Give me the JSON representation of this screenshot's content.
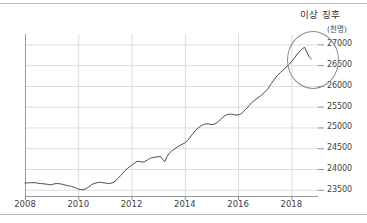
{
  "chart_data": {
    "type": "line",
    "title": "",
    "subtitle": "",
    "xlabel": "",
    "ylabel": "",
    "unit_label": "(천명)",
    "annotations": [
      {
        "name": "abnormal-sign",
        "text": "이상 징후",
        "shape": "ellipse",
        "targets_x_range": [
          2017.2,
          2018.9
        ],
        "targets_y_range": [
          26450,
          27050
        ]
      }
    ],
    "grid": true,
    "legend": "none",
    "xlim": [
      2008.0,
      2019.0
    ],
    "ylim": [
      23350,
      27250
    ],
    "xticks": [
      "2008",
      "2010",
      "2012",
      "2014",
      "2016",
      "2018"
    ],
    "xtick_values": [
      2008,
      2010,
      2012,
      2014,
      2016,
      2018
    ],
    "yticks": [
      "23500",
      "24000",
      "24500",
      "25000",
      "25500",
      "26000",
      "26500",
      "27000"
    ],
    "ytick_values": [
      23500,
      24000,
      24500,
      25000,
      25500,
      26000,
      26500,
      27000
    ],
    "series": [
      {
        "name": "취업자수",
        "color": "#4a4a4a",
        "x": [
          2008.0,
          2008.09,
          2008.17,
          2008.25,
          2008.34,
          2008.42,
          2008.5,
          2008.59,
          2008.67,
          2008.75,
          2008.84,
          2008.92,
          2009.0,
          2009.09,
          2009.17,
          2009.25,
          2009.34,
          2009.42,
          2009.5,
          2009.59,
          2009.67,
          2009.75,
          2009.84,
          2009.92,
          2010.0,
          2010.09,
          2010.17,
          2010.25,
          2010.34,
          2010.42,
          2010.5,
          2010.59,
          2010.67,
          2010.75,
          2010.84,
          2010.92,
          2011.0,
          2011.09,
          2011.17,
          2011.25,
          2011.34,
          2011.42,
          2011.5,
          2011.59,
          2011.67,
          2011.75,
          2011.84,
          2011.92,
          2012.0,
          2012.09,
          2012.17,
          2012.25,
          2012.34,
          2012.42,
          2012.5,
          2012.59,
          2012.67,
          2012.75,
          2012.84,
          2012.92,
          2013.0,
          2013.09,
          2013.17,
          2013.25,
          2013.34,
          2013.42,
          2013.5,
          2013.59,
          2013.67,
          2013.75,
          2013.84,
          2013.92,
          2014.0,
          2014.09,
          2014.17,
          2014.25,
          2014.34,
          2014.42,
          2014.5,
          2014.59,
          2014.67,
          2014.75,
          2014.84,
          2014.92,
          2015.0,
          2015.09,
          2015.17,
          2015.25,
          2015.34,
          2015.42,
          2015.5,
          2015.59,
          2015.67,
          2015.75,
          2015.84,
          2015.92,
          2016.0,
          2016.09,
          2016.17,
          2016.25,
          2016.34,
          2016.42,
          2016.5,
          2016.59,
          2016.67,
          2016.75,
          2016.84,
          2016.92,
          2017.0,
          2017.09,
          2017.17,
          2017.25,
          2017.34,
          2017.42,
          2017.5,
          2017.59,
          2017.67,
          2017.75,
          2017.84,
          2017.92,
          2018.0,
          2018.09,
          2018.17,
          2018.25,
          2018.34,
          2018.42,
          2018.5,
          2018.59,
          2018.67,
          2018.75
        ],
        "values": [
          23660,
          23665,
          23670,
          23668,
          23672,
          23665,
          23655,
          23650,
          23645,
          23640,
          23630,
          23620,
          23625,
          23640,
          23650,
          23648,
          23640,
          23630,
          23615,
          23600,
          23595,
          23580,
          23560,
          23540,
          23520,
          23505,
          23500,
          23515,
          23545,
          23580,
          23620,
          23650,
          23665,
          23675,
          23680,
          23670,
          23665,
          23655,
          23650,
          23660,
          23690,
          23730,
          23780,
          23840,
          23900,
          23960,
          24010,
          24050,
          24090,
          24130,
          24170,
          24185,
          24175,
          24165,
          24180,
          24215,
          24250,
          24270,
          24280,
          24290,
          24295,
          24300,
          24230,
          24180,
          24310,
          24380,
          24430,
          24470,
          24510,
          24545,
          24575,
          24600,
          24630,
          24680,
          24740,
          24810,
          24880,
          24940,
          24990,
          25030,
          25060,
          25080,
          25090,
          25080,
          25070,
          25075,
          25100,
          25140,
          25190,
          25240,
          25280,
          25310,
          25320,
          25320,
          25310,
          25300,
          25300,
          25320,
          25360,
          25410,
          25470,
          25530,
          25590,
          25640,
          25680,
          25720,
          25760,
          25800,
          25850,
          25910,
          25980,
          26060,
          26140,
          26210,
          26270,
          26320,
          26370,
          26420,
          26470,
          26520,
          26580,
          26650,
          26720,
          26790,
          26850,
          26900,
          26930,
          26800,
          26700,
          26650
        ]
      }
    ]
  }
}
